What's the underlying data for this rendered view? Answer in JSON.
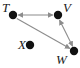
{
  "figure": {
    "type": "directed-graph-diagram",
    "background_color": "#ffffff",
    "node_color": "#111111",
    "edge_color": "#8c8c8c",
    "label_color": "#1a1a1a",
    "node_radius": 4.2,
    "width": 80,
    "height": 68
  },
  "graph_data": {
    "type": "graph",
    "nodes": [
      {
        "id": "T",
        "label": "T",
        "x": 13,
        "y": 15,
        "label_x": 2,
        "label_y": 1
      },
      {
        "id": "V",
        "label": "V",
        "x": 58,
        "y": 15,
        "label_x": 63,
        "label_y": 1
      },
      {
        "id": "X",
        "label": "X",
        "x": 30,
        "y": 45,
        "label_x": 18,
        "label_y": 38
      },
      {
        "id": "W",
        "label": "W",
        "x": 74,
        "y": 51,
        "label_x": 57,
        "label_y": 53
      }
    ],
    "edges": [
      {
        "from": "T",
        "to": "V",
        "directed": true,
        "bidirectional": true
      },
      {
        "from": "V",
        "to": "W",
        "directed": true,
        "bidirectional": true
      },
      {
        "from": "T",
        "to": "W",
        "directed": true,
        "bidirectional": false
      }
    ],
    "isolated_nodes": [
      "X"
    ]
  },
  "labels": {
    "t": "T",
    "v": "V",
    "x": "X",
    "w": "W"
  }
}
